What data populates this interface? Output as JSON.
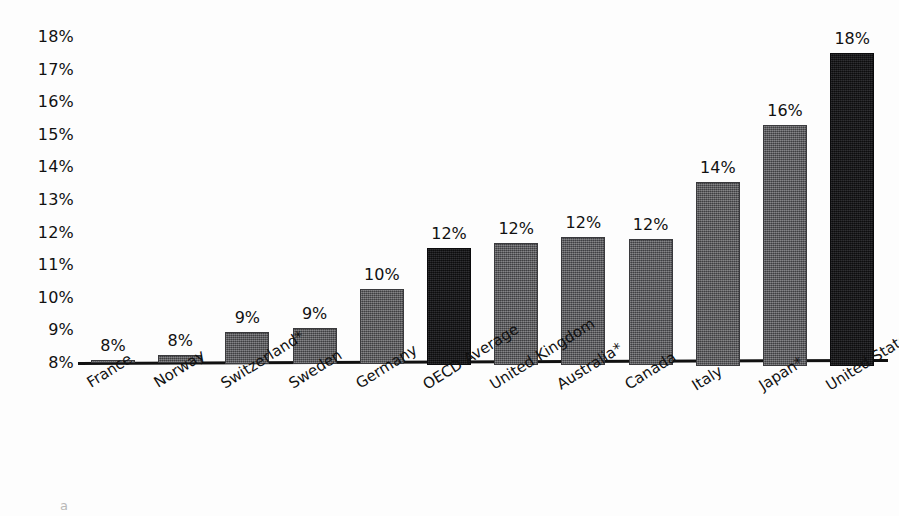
{
  "chart_data": {
    "type": "bar",
    "title": "",
    "xlabel": "",
    "ylabel": "",
    "ylim": [
      8,
      18
    ],
    "grid": false,
    "legend": "none",
    "y_ticks": [
      "18%",
      "17%",
      "16%",
      "15%",
      "14%",
      "13%",
      "12%",
      "11%",
      "10%",
      "9%",
      "8%"
    ],
    "y_tick_values": [
      18,
      17,
      16,
      15,
      14,
      13,
      12,
      11,
      10,
      9,
      8
    ],
    "categories": [
      "France",
      "Norway",
      "Switzerland*",
      "Sweden",
      "Germany",
      "OECD Average",
      "United Kingdom",
      "Australia*",
      "Canada",
      "Italy",
      "Japan*",
      "United States"
    ],
    "values": [
      8.05,
      8.25,
      8.95,
      9.1,
      10.3,
      11.55,
      11.7,
      11.9,
      11.85,
      13.6,
      15.35,
      17.55
    ],
    "data_labels": [
      "8%",
      "8%",
      "9%",
      "9%",
      "10%",
      "12%",
      "12%",
      "12%",
      "12%",
      "14%",
      "16%",
      "18%"
    ],
    "bar_styles": [
      "gray",
      "gray",
      "gray",
      "gray",
      "gray",
      "dark",
      "gray",
      "gray",
      "gray",
      "gray",
      "gray",
      "dark"
    ],
    "colors": {
      "bar_gray": "#56565a",
      "bar_dark": "#161619",
      "axis": "#111111",
      "text": "#111111",
      "background": "#fdfdfd"
    },
    "annotations": [
      "* indicates an asterisked country label"
    ]
  },
  "footnote": {
    "text": "a"
  }
}
